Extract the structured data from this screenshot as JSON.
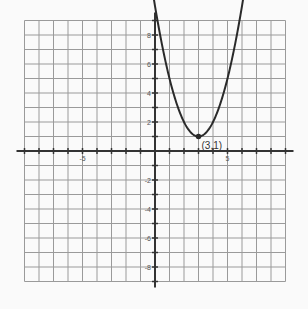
{
  "chart_data": {
    "type": "line",
    "title": "",
    "xlabel": "",
    "ylabel": "",
    "equation": "y = (x - 3)^2 + 1",
    "xlim": [
      -9,
      9
    ],
    "ylim": [
      -9,
      9
    ],
    "grid": true,
    "x_tick_labels": [
      {
        "value": -5,
        "label": "-5"
      },
      {
        "value": 5,
        "label": "5"
      }
    ],
    "y_tick_labels": [
      {
        "value": 8,
        "label": "8"
      },
      {
        "value": 6,
        "label": "6"
      },
      {
        "value": 4,
        "label": "4"
      },
      {
        "value": 2,
        "label": "2"
      },
      {
        "value": -2,
        "label": "-2"
      },
      {
        "value": -4,
        "label": "-4"
      },
      {
        "value": -6,
        "label": "-6"
      },
      {
        "value": -8,
        "label": "-8"
      }
    ],
    "series": [
      {
        "name": "parabola",
        "x": [
          -0.16,
          0,
          0.5,
          1,
          1.5,
          2,
          2.5,
          3,
          3.5,
          4,
          4.5,
          5,
          5.5,
          6,
          6.16
        ],
        "y": [
          11.0,
          10,
          7.25,
          5,
          3.25,
          2,
          1.25,
          1,
          1.25,
          2,
          3.25,
          5,
          7.25,
          10,
          11.0
        ]
      }
    ],
    "annotations": [
      {
        "x": 3,
        "y": 1,
        "label": "(3,1)",
        "marker": "point"
      }
    ]
  }
}
